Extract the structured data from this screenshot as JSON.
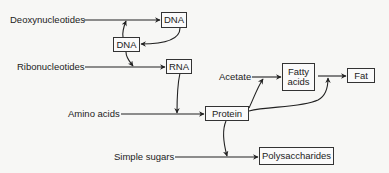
{
  "diagram": {
    "sources": {
      "deoxynucleotides": "Deoxynucleotides",
      "ribonucleotides": "Ribonucleotides",
      "amino_acids": "Amino acids",
      "simple_sugars": "Simple sugars",
      "acetate": "Acetate"
    },
    "boxes": {
      "dna_top": "DNA",
      "dna_mid": "DNA",
      "rna": "RNA",
      "protein": "Protein",
      "fatty_acids_line1": "Fatty",
      "fatty_acids_line2": "acids",
      "fat": "Fat",
      "polysaccharides": "Polysaccharides"
    },
    "edges": [
      {
        "from": "Deoxynucleotides",
        "to": "DNA (top)"
      },
      {
        "from": "DNA (top)",
        "to": "DNA (middle)"
      },
      {
        "from": "DNA (middle)",
        "to": "Deoxynucleotides→DNA line"
      },
      {
        "from": "DNA (middle)",
        "to": "Ribonucleotides→RNA line"
      },
      {
        "from": "Ribonucleotides",
        "to": "RNA"
      },
      {
        "from": "RNA",
        "to": "Amino acids→Protein line"
      },
      {
        "from": "Amino acids",
        "to": "Protein"
      },
      {
        "from": "Acetate",
        "to": "Fatty acids"
      },
      {
        "from": "Protein",
        "to": "Acetate→Fatty acids line"
      },
      {
        "from": "Fatty acids",
        "to": "Fat"
      },
      {
        "from": "Protein",
        "to": "Fatty acids→Fat line"
      },
      {
        "from": "Protein",
        "to": "Simple sugars→Polysaccharides line"
      },
      {
        "from": "Simple sugars",
        "to": "Polysaccharides"
      }
    ],
    "colors": {
      "line": "#222222",
      "background": "#f7f7f5"
    }
  }
}
